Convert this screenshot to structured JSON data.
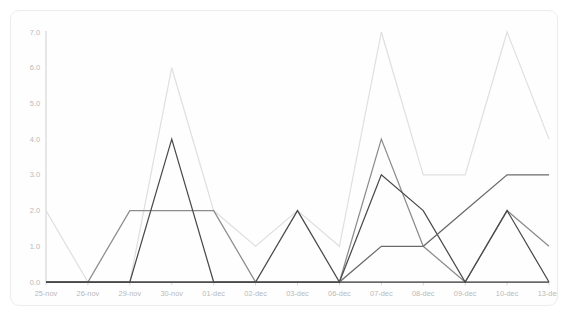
{
  "chart_data": {
    "type": "line",
    "title": "",
    "subtitle": "",
    "xlabel": "",
    "ylabel": "",
    "categories": [
      "25-nov",
      "26-nov",
      "29-nov",
      "30-nov",
      "01-dec",
      "02-dec",
      "03-dec",
      "06-dec",
      "07-dec",
      "08-dec",
      "09-dec",
      "10-dec",
      "13-dec"
    ],
    "ylim": [
      0.0,
      7.0
    ],
    "yticks": [
      0.0,
      1.0,
      2.0,
      3.0,
      4.0,
      5.0,
      6.0,
      7.0
    ],
    "ytick_labels": [
      "0.0",
      "1.0",
      "2.0",
      "3.0",
      "4.0",
      "5.0",
      "6.0",
      "7.0"
    ],
    "grid": false,
    "legend": "none",
    "series": [
      {
        "name": "series-1",
        "color": "#e0e0e0",
        "values": [
          2.0,
          0.0,
          0.0,
          6.0,
          2.0,
          1.0,
          2.0,
          1.0,
          7.0,
          3.0,
          3.0,
          7.0,
          4.0
        ]
      },
      {
        "name": "series-2",
        "color": "#8c8c8c",
        "values": [
          0.0,
          0.0,
          2.0,
          2.0,
          2.0,
          0.0,
          0.0,
          0.0,
          4.0,
          1.0,
          0.0,
          2.0,
          1.0
        ]
      },
      {
        "name": "series-3",
        "color": "#4a4a4a",
        "values": [
          0.0,
          0.0,
          0.0,
          4.0,
          0.0,
          0.0,
          2.0,
          0.0,
          3.0,
          2.0,
          0.0,
          2.0,
          0.0
        ]
      },
      {
        "name": "series-4",
        "color": "#6b6b6b",
        "values": [
          0.0,
          0.0,
          0.0,
          0.0,
          0.0,
          0.0,
          0.0,
          0.0,
          1.0,
          1.0,
          2.0,
          3.0,
          3.0
        ]
      },
      {
        "name": "series-5",
        "color": "#3d3d3d",
        "values": [
          0.0,
          0.0,
          0.0,
          0.0,
          0.0,
          0.0,
          0.0,
          0.0,
          0.0,
          0.0,
          0.0,
          0.0,
          0.0
        ]
      }
    ]
  }
}
